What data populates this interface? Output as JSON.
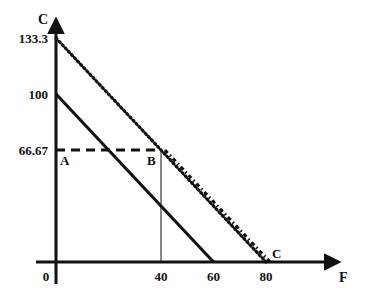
{
  "chart_data": {
    "type": "line",
    "title": "",
    "xlabel": "F",
    "ylabel": "C",
    "xlim": [
      0,
      105
    ],
    "ylim": [
      0,
      145
    ],
    "grid": false,
    "legend": null,
    "x_ticks": [
      {
        "value": 0,
        "label": "0"
      },
      {
        "value": 40,
        "label": "40"
      },
      {
        "value": 60,
        "label": "60"
      },
      {
        "value": 80,
        "label": "80"
      }
    ],
    "y_ticks": [
      {
        "value": 133.3,
        "label": "133.3"
      },
      {
        "value": 100,
        "label": "100"
      },
      {
        "value": 66.67,
        "label": "66.67"
      }
    ],
    "series": [
      {
        "name": "solid budget line",
        "style": "solid",
        "points": [
          [
            0,
            100
          ],
          [
            60,
            0
          ]
        ]
      },
      {
        "name": "dotted budget line",
        "style": "dotted",
        "points": [
          [
            0,
            133.3
          ],
          [
            80,
            0
          ]
        ]
      },
      {
        "name": "kinked budget line",
        "style": "dash-dot",
        "points": [
          [
            40,
            66.67
          ],
          [
            80,
            0
          ]
        ]
      },
      {
        "name": "horizontal dashed line",
        "style": "dashed",
        "points": [
          [
            0,
            66.67
          ],
          [
            40,
            66.67
          ]
        ]
      },
      {
        "name": "vertical guide",
        "style": "thin",
        "points": [
          [
            40,
            0
          ],
          [
            40,
            66.67
          ]
        ]
      }
    ],
    "annotations": [
      {
        "label": "A",
        "x": 0,
        "y": 66.67
      },
      {
        "label": "B",
        "x": 40,
        "y": 66.67
      },
      {
        "label": "C",
        "x": 80,
        "y": 0
      }
    ],
    "colors": {
      "ink": "#111111",
      "background": "#ffffff"
    }
  }
}
